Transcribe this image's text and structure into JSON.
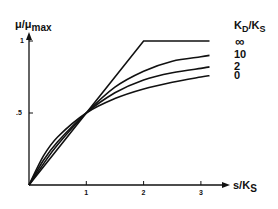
{
  "chart_data": {
    "type": "line",
    "title": "",
    "xlabel": "s/K_S",
    "xlabel_main": "s/K",
    "xlabel_sub": "S",
    "ylabel": "μ/μ_max",
    "ylabel_main": "μ/μ",
    "ylabel_sub": "max",
    "xlim": [
      0,
      3.5
    ],
    "ylim": [
      0,
      1.1
    ],
    "grid": false,
    "legend_position": "right",
    "legend_title": "K_D/K_S",
    "legend_title_parts": {
      "a": "K",
      "a_sub": "D",
      "sep": "/",
      "b": "K",
      "b_sub": "S"
    },
    "x_ticks": [
      {
        "value": 1,
        "label": "1"
      },
      {
        "value": 2,
        "label": "2"
      },
      {
        "value": 3,
        "label": "3"
      }
    ],
    "y_ticks": [
      {
        "value": 0.5,
        "label": ".5"
      },
      {
        "value": 1,
        "label": "1"
      }
    ],
    "series": [
      {
        "name": "∞",
        "x": [
          0,
          1,
          2,
          3.15
        ],
        "values": [
          0,
          0.5,
          1.0,
          1.0
        ]
      },
      {
        "name": "10",
        "x": [
          0,
          0.25,
          0.5,
          1,
          1.5,
          2,
          2.5,
          3,
          3.15
        ],
        "values": [
          0,
          0.145,
          0.28,
          0.5,
          0.68,
          0.79,
          0.86,
          0.89,
          0.9
        ]
      },
      {
        "name": "2",
        "x": [
          0,
          0.25,
          0.5,
          1,
          1.5,
          2,
          2.5,
          3,
          3.15
        ],
        "values": [
          0,
          0.17,
          0.3,
          0.5,
          0.64,
          0.73,
          0.78,
          0.81,
          0.82
        ]
      },
      {
        "name": "0",
        "x": [
          0,
          0.25,
          0.5,
          1,
          1.5,
          2,
          2.5,
          3,
          3.15
        ],
        "values": [
          0,
          0.2,
          0.333,
          0.5,
          0.6,
          0.667,
          0.714,
          0.75,
          0.759
        ]
      }
    ],
    "annotations": [
      "All curves intersect at s/K_S = 1, μ/μmax = 0.5"
    ]
  },
  "colors": {
    "line": "#111111",
    "background": "#ffffff"
  }
}
